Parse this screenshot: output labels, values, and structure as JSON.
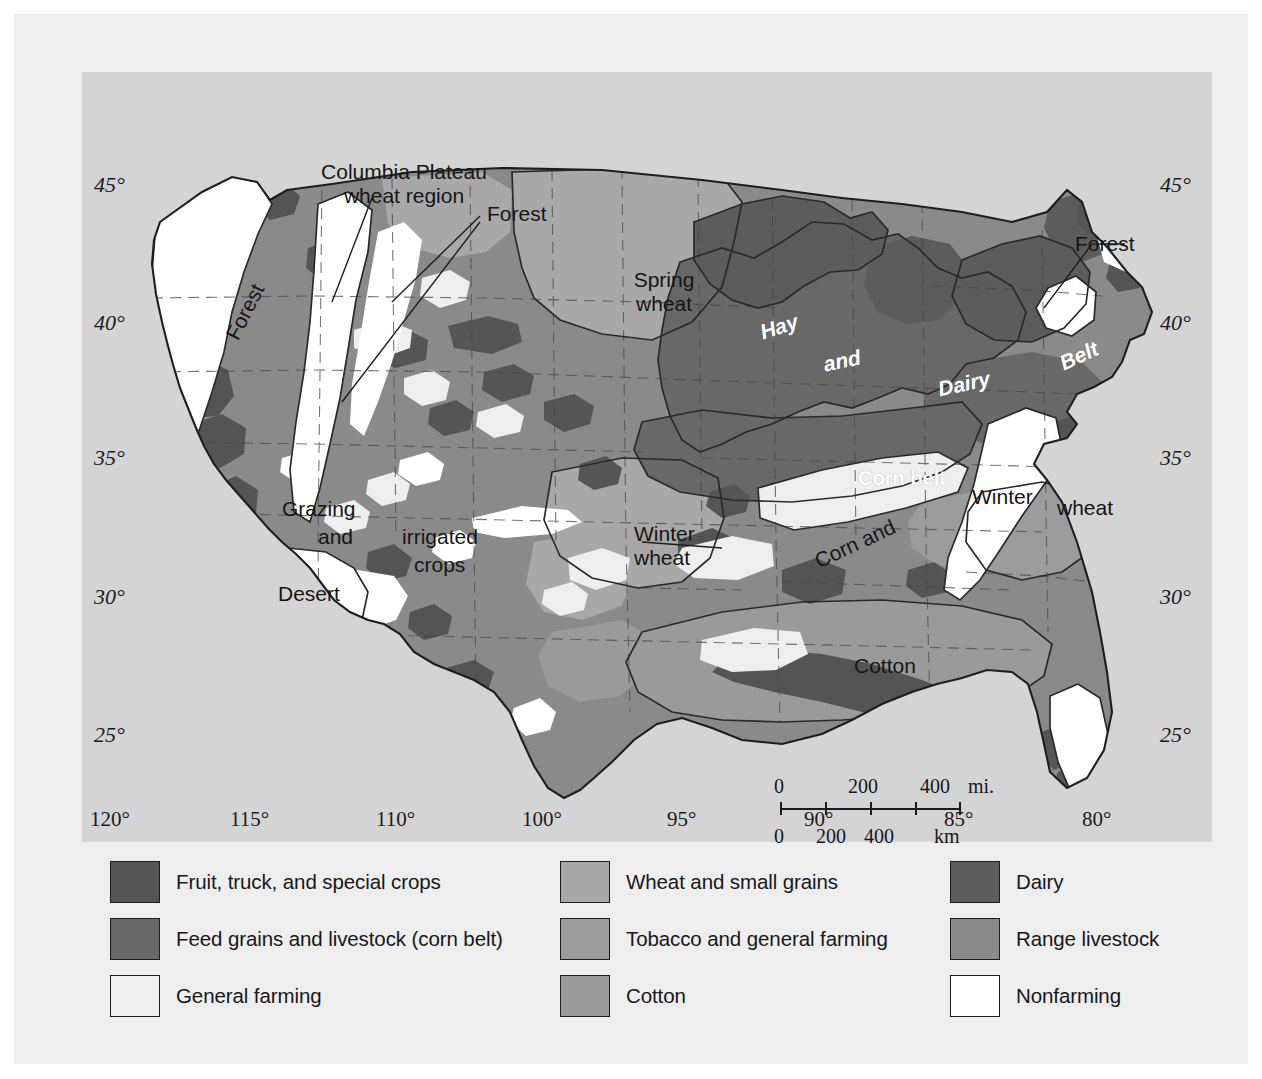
{
  "map": {
    "background_color": "#d4d4d4",
    "paper_color": "#eeeeee",
    "labels": [
      {
        "id": "columbia",
        "text": "Columbia Plateau\nwheat region",
        "style": "dark",
        "x": 207,
        "y": 88,
        "w": 230,
        "align": "center"
      },
      {
        "id": "forest_nw",
        "text": "Forest",
        "style": "dark",
        "x": 118,
        "y": 228,
        "w": 90,
        "align": "center",
        "rotate": -63
      },
      {
        "id": "forest_n",
        "text": "Forest",
        "style": "dark",
        "x": 405,
        "y": 130,
        "w": 110,
        "align": "left"
      },
      {
        "id": "forest_ne",
        "text": "Forest",
        "style": "dark",
        "x": 993,
        "y": 160,
        "w": 110,
        "align": "left"
      },
      {
        "id": "spring_wheat",
        "text": "Spring\nwheat",
        "style": "dark",
        "x": 527,
        "y": 196,
        "w": 110,
        "align": "center"
      },
      {
        "id": "hay",
        "text": "Hay",
        "style": "whiteit",
        "x": 662,
        "y": 243,
        "w": 70,
        "align": "center",
        "rotate": -18
      },
      {
        "id": "and",
        "text": "and",
        "style": "whiteit",
        "x": 725,
        "y": 277,
        "w": 70,
        "align": "center",
        "rotate": -12
      },
      {
        "id": "dairy",
        "text": "Dairy",
        "style": "whiteit",
        "x": 842,
        "y": 300,
        "w": 80,
        "align": "center",
        "rotate": -12
      },
      {
        "id": "belt",
        "text": "Belt",
        "style": "whiteit",
        "x": 962,
        "y": 272,
        "w": 70,
        "align": "center",
        "rotate": -25
      },
      {
        "id": "corn_belt",
        "text": "Corn belt",
        "style": "white",
        "x": 760,
        "y": 395,
        "w": 120,
        "align": "center"
      },
      {
        "id": "winter_e",
        "text": "Winter",
        "style": "dark",
        "x": 890,
        "y": 413,
        "w": 90,
        "align": "left"
      },
      {
        "id": "wheat_e",
        "text": "wheat",
        "style": "dark",
        "x": 975,
        "y": 424,
        "w": 90,
        "align": "left"
      },
      {
        "id": "grazing",
        "text": "Grazing",
        "style": "dark",
        "x": 200,
        "y": 425,
        "w": 110,
        "align": "left"
      },
      {
        "id": "and_sw",
        "text": "and",
        "style": "dark",
        "x": 236,
        "y": 453,
        "w": 70,
        "align": "left"
      },
      {
        "id": "irrigated",
        "text": "irrigated",
        "style": "dark",
        "x": 320,
        "y": 453,
        "w": 120,
        "align": "left"
      },
      {
        "id": "crops",
        "text": "crops",
        "style": "dark",
        "x": 332,
        "y": 481,
        "w": 90,
        "align": "left"
      },
      {
        "id": "desert",
        "text": "Desert",
        "style": "dark",
        "x": 196,
        "y": 510,
        "w": 100,
        "align": "left"
      },
      {
        "id": "winter_c",
        "text": "Winter\nwheat",
        "style": "dark",
        "x": 552,
        "y": 450,
        "w": 110,
        "align": "left"
      },
      {
        "id": "corn_and",
        "text": "Corn and",
        "style": "dark",
        "x": 708,
        "y": 460,
        "w": 130,
        "align": "center",
        "rotate": -25
      },
      {
        "id": "cotton",
        "text": "Cotton",
        "style": "dark",
        "x": 772,
        "y": 582,
        "w": 100,
        "align": "left"
      }
    ],
    "latitude_ticks_left": [
      "45°",
      "40°",
      "35°",
      "30°",
      "25°"
    ],
    "latitude_ticks_right": [
      "45°",
      "40°",
      "35°",
      "30°",
      "25°"
    ],
    "longitude_ticks": [
      "120°",
      "115°",
      "110°",
      "100°",
      "95°",
      "90°",
      "85°",
      "80°"
    ]
  },
  "scalebar": {
    "miles_values": [
      "0",
      "200",
      "400"
    ],
    "miles_unit": "mi.",
    "km_values": [
      "0",
      "200",
      "400"
    ],
    "km_unit": "km"
  },
  "legend": {
    "columns": [
      {
        "items": [
          {
            "label": "Fruit, truck, and special crops",
            "color": "#555555"
          },
          {
            "label": "Feed grains and livestock (corn belt)",
            "color": "#686868"
          },
          {
            "label": "General farming",
            "color": "#eeeeee"
          }
        ]
      },
      {
        "items": [
          {
            "label": "Wheat and small grains",
            "color": "#a8a8a8"
          },
          {
            "label": "Tobacco and general farming",
            "color": "#9c9c9c"
          },
          {
            "label": "Cotton",
            "color": "#9a9a9a"
          }
        ]
      },
      {
        "items": [
          {
            "label": "Dairy",
            "color": "#5c5c5c"
          },
          {
            "label": "Range livestock",
            "color": "#8a8a8a"
          },
          {
            "label": "Nonfarming",
            "color": "#ffffff"
          }
        ]
      }
    ]
  },
  "colors": {
    "fruit_truck": "#555555",
    "feed_grains": "#686868",
    "general_farming": "#eeeeee",
    "wheat_small_grains": "#a8a8a8",
    "tobacco": "#9c9c9c",
    "cotton": "#9a9a9a",
    "dairy": "#5c5c5c",
    "range_livestock": "#8a8a8a",
    "nonfarming": "#ffffff",
    "outline": "#2a2a2a",
    "map_bg": "#d4d4d4"
  }
}
